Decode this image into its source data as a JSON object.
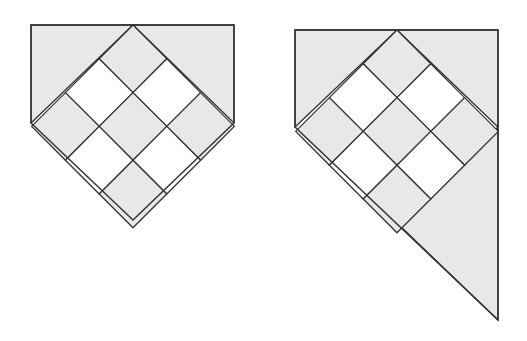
{
  "diagram": {
    "colors": {
      "background": "#ffffff",
      "shaded": "#e8e8e8",
      "white_tile": "#ffffff",
      "stroke": "#333333"
    },
    "figures": [
      {
        "id": "left-figure",
        "label": "pentagon block",
        "apex": [
          133,
          25
        ],
        "half_diagonal": 33.8,
        "outline": [
          [
            31,
            25
          ],
          [
            234,
            25
          ],
          [
            234,
            123
          ],
          [
            133,
            220
          ],
          [
            31,
            123
          ]
        ],
        "tiles": [
          {
            "r": 0,
            "c": 0,
            "fill": "shaded"
          },
          {
            "r": 0,
            "c": 1,
            "fill": "white"
          },
          {
            "r": 0,
            "c": 2,
            "fill": "shaded"
          },
          {
            "r": 1,
            "c": 0,
            "fill": "white"
          },
          {
            "r": 1,
            "c": 1,
            "fill": "shaded"
          },
          {
            "r": 1,
            "c": 2,
            "fill": "white"
          },
          {
            "r": 2,
            "c": 0,
            "fill": "shaded"
          },
          {
            "r": 2,
            "c": 1,
            "fill": "white"
          },
          {
            "r": 2,
            "c": 2,
            "fill": "shaded"
          }
        ],
        "corner_triangles": [
          [
            [
              31,
              25
            ],
            [
              133,
              25
            ],
            [
              31,
              123
            ]
          ],
          [
            [
              133,
              25
            ],
            [
              234,
              25
            ],
            [
              234,
              123
            ]
          ]
        ]
      },
      {
        "id": "right-figure",
        "label": "extended block with lower-right triangle",
        "apex": [
          397,
          30
        ],
        "half_diagonal": 33.8,
        "outline": [
          [
            295,
            30
          ],
          [
            498,
            30
          ],
          [
            498,
            320
          ],
          [
            295,
            127
          ]
        ],
        "tiles": [
          {
            "r": 0,
            "c": 0,
            "fill": "shaded"
          },
          {
            "r": 0,
            "c": 1,
            "fill": "white"
          },
          {
            "r": 0,
            "c": 2,
            "fill": "shaded"
          },
          {
            "r": 1,
            "c": 0,
            "fill": "white"
          },
          {
            "r": 1,
            "c": 1,
            "fill": "shaded"
          },
          {
            "r": 1,
            "c": 2,
            "fill": "white"
          },
          {
            "r": 2,
            "c": 0,
            "fill": "shaded"
          },
          {
            "r": 2,
            "c": 1,
            "fill": "white"
          },
          {
            "r": 2,
            "c": 2,
            "fill": "shaded"
          }
        ],
        "corner_triangles": [
          [
            [
              295,
              30
            ],
            [
              397,
              30
            ],
            [
              295,
              127
            ]
          ],
          [
            [
              397,
              30
            ],
            [
              498,
              30
            ],
            [
              498,
              127
            ]
          ],
          [
            [
              498,
              127
            ],
            [
              498,
              320
            ],
            [
              397,
              223
            ]
          ]
        ]
      }
    ]
  }
}
